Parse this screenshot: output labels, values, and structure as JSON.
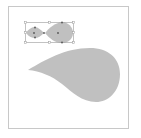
{
  "artboard": {
    "background": "#ffffff",
    "frame_color": "#c8c8c8"
  },
  "shapes": {
    "fill": "#c0c0c0",
    "selection_color": "#9a9a9a",
    "anchor_color": "#555555"
  },
  "icons": {
    "small_group": "teardrop-pair-icon",
    "large_shape": "teardrop-icon"
  }
}
